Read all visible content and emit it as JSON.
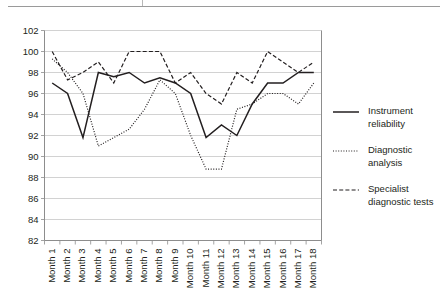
{
  "chart_data": {
    "type": "line",
    "title": "",
    "xlabel": "",
    "ylabel": "",
    "ylim": [
      82,
      102
    ],
    "ytick_step": 2,
    "yticks": [
      82,
      84,
      86,
      88,
      90,
      92,
      94,
      96,
      98,
      100,
      102
    ],
    "grid": true,
    "legend_position": "right",
    "categories": [
      "Month 1",
      "Month 2",
      "Month 3",
      "Month 4",
      "Month 5",
      "Month 6",
      "Month 7",
      "Month 8",
      "Month 9",
      "Month 10",
      "Month 11",
      "Month 12",
      "Month 13",
      "Month 14",
      "Month 15",
      "Month 16",
      "Month 17",
      "Month 18"
    ],
    "series": [
      {
        "name": "Instrument reliability",
        "style": "solid",
        "color": "#231f20",
        "values": [
          97,
          96,
          91.8,
          98,
          97.6,
          98,
          97,
          97.5,
          97,
          96,
          91.8,
          93,
          92,
          95,
          97,
          97,
          98,
          98
        ]
      },
      {
        "name": "Diagnostic analysis",
        "style": "dotted",
        "color": "#231f20",
        "values": [
          99.3,
          98,
          96,
          91,
          91.8,
          92.6,
          94.5,
          97.3,
          96,
          92,
          88.8,
          88.8,
          94.5,
          95,
          96,
          96,
          95,
          97
        ]
      },
      {
        "name": "Specialist diagnostic tests",
        "style": "dashed",
        "color": "#231f20",
        "values": [
          100,
          97.3,
          98,
          99,
          97,
          100,
          100,
          100,
          97,
          98,
          96,
          95,
          98,
          97,
          100,
          99,
          98,
          99
        ]
      }
    ]
  },
  "legend": {
    "items": [
      {
        "label_line1": "Instrument",
        "label_line2": "reliability",
        "style": "solid"
      },
      {
        "label_line1": "Diagnostic",
        "label_line2": "analysis",
        "style": "dotted"
      },
      {
        "label_line1": "Specialist",
        "label_line2": "diagnostic tests",
        "style": "dashed"
      }
    ]
  }
}
